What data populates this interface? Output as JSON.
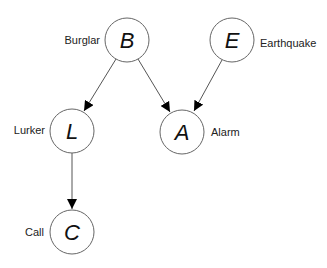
{
  "diagram": {
    "type": "bayesian-network",
    "nodes": [
      {
        "id": "B",
        "letter": "B",
        "label": "Burglar",
        "cx": 127,
        "cy": 40,
        "label_side": "left"
      },
      {
        "id": "E",
        "letter": "E",
        "label": "Earthquake",
        "cx": 232,
        "cy": 40,
        "label_side": "right"
      },
      {
        "id": "L",
        "letter": "L",
        "label": "Lurker",
        "cx": 72,
        "cy": 131,
        "label_side": "left"
      },
      {
        "id": "A",
        "letter": "A",
        "label": "Alarm",
        "cx": 182,
        "cy": 132,
        "label_side": "right"
      },
      {
        "id": "C",
        "letter": "C",
        "label": "Call",
        "cx": 72,
        "cy": 232,
        "label_side": "left"
      }
    ],
    "edges": [
      {
        "from": "B",
        "to": "L"
      },
      {
        "from": "B",
        "to": "A"
      },
      {
        "from": "E",
        "to": "A"
      },
      {
        "from": "L",
        "to": "C"
      }
    ],
    "colors": {
      "stroke": "#555555",
      "arrow": "#000000",
      "text": "#111111"
    }
  }
}
